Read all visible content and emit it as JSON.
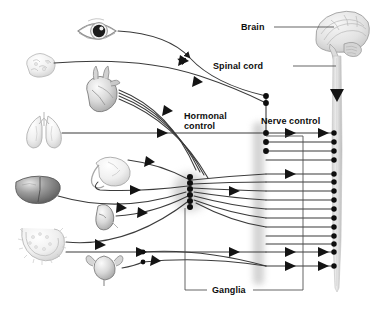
{
  "diagram": {
    "background_color": "#ffffff",
    "width": 372,
    "height": 320,
    "line_color": "#3b3b3b",
    "text_color": "#0d0d0d",
    "node_color": "#111111",
    "chain_color": "#b9b9b9"
  },
  "labels": {
    "brain": "Brain",
    "spinal_cord": "Spinal cord",
    "hormonal_control_line1": "Hormonal",
    "hormonal_control_line2": "control",
    "nerve_control": "Nerve control",
    "ganglia": "Ganglia"
  },
  "organs": [
    {
      "name": "eye",
      "label": "Eye",
      "x": 96,
      "y": 30
    },
    {
      "name": "salivary-gland",
      "label": "Salivary gland",
      "x": 42,
      "y": 67
    },
    {
      "name": "heart",
      "label": "Heart",
      "x": 101,
      "y": 92
    },
    {
      "name": "lungs",
      "label": "Lungs",
      "x": 42,
      "y": 128
    },
    {
      "name": "stomach",
      "label": "Stomach",
      "x": 106,
      "y": 172
    },
    {
      "name": "liver",
      "label": "Liver",
      "x": 35,
      "y": 190
    },
    {
      "name": "kidney",
      "label": "Kidney",
      "x": 104,
      "y": 216
    },
    {
      "name": "intestines",
      "label": "Intestines",
      "x": 37,
      "y": 240
    },
    {
      "name": "bladder",
      "label": "Bladder",
      "x": 104,
      "y": 268
    },
    {
      "name": "brain",
      "label": "Brain",
      "x": 338,
      "y": 40
    }
  ],
  "structures": {
    "spinal_cord_nodes_count": 15,
    "ganglia_cluster_nodes_count": 6,
    "cranial_nodes_count": 3,
    "sacral_nodes_count": 2,
    "sympathetic_chain_label": "sympathetic-chain"
  }
}
